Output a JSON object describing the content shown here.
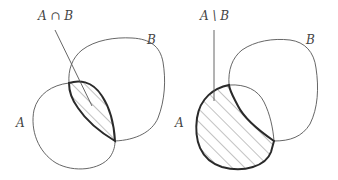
{
  "figures": [
    {
      "id": "intersection",
      "title_label": "A ∩ B",
      "set_a_label": "A",
      "set_b_label": "B",
      "shaded_region": "intersection"
    },
    {
      "id": "difference",
      "title_label": "A \\ B",
      "set_a_label": "A",
      "set_b_label": "B",
      "shaded_region": "A minus B"
    }
  ],
  "colors": {
    "outline": "#555555",
    "bold_outline": "#2a2a2a",
    "hatch": "#777777",
    "label": "#444444",
    "background": "#ffffff"
  }
}
